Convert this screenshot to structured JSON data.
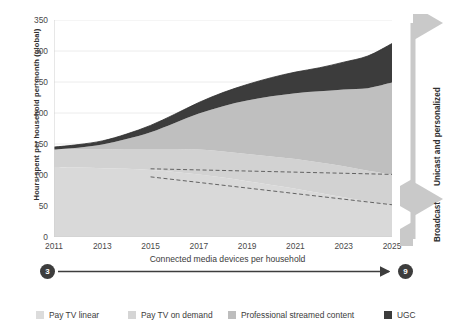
{
  "chart_data": {
    "type": "area",
    "title": "",
    "ylabel": "Hours spent per household per month (global)",
    "xlabel": "",
    "ylim": [
      0,
      350
    ],
    "yticks": [
      0,
      50,
      100,
      150,
      200,
      250,
      300,
      350
    ],
    "x": [
      2011,
      2012,
      2013,
      2014,
      2015,
      2016,
      2017,
      2018,
      2019,
      2020,
      2021,
      2022,
      2023,
      2024,
      2025
    ],
    "xticks": [
      2011,
      2013,
      2015,
      2017,
      2019,
      2021,
      2023,
      2025
    ],
    "grid": true,
    "legend_position": "bottom",
    "stacked": true,
    "series": [
      {
        "name": "Pay TV linear",
        "color": "#d9d9d9",
        "values": [
          113,
          112,
          111,
          110,
          108,
          105,
          101,
          96,
          90,
          84,
          78,
          71,
          64,
          57,
          51
        ]
      },
      {
        "name": "Pay TV on demand",
        "color": "#d2d2d2",
        "values": [
          28,
          29,
          30,
          32,
          34,
          37,
          40,
          42,
          44,
          46,
          48,
          49,
          50,
          50,
          50
        ]
      },
      {
        "name": "Professional streamed content",
        "color": "#bfbfbf",
        "values": [
          0,
          3,
          8,
          16,
          27,
          42,
          58,
          73,
          86,
          97,
          106,
          115,
          124,
          133,
          148
        ]
      },
      {
        "name": "UGC",
        "color": "#3c3c3c",
        "values": [
          4,
          5,
          6,
          8,
          11,
          14,
          18,
          22,
          26,
          30,
          34,
          38,
          44,
          52,
          63
        ]
      }
    ],
    "annotations": [
      {
        "name": "dashed-divider-upper",
        "style": "dashed",
        "x": [
          2015,
          2025
        ],
        "y": [
          110,
          101
        ]
      },
      {
        "name": "dashed-divider-lower",
        "style": "dashed",
        "x": [
          2015,
          2025
        ],
        "y": [
          97,
          52
        ]
      }
    ]
  },
  "side_annotations": {
    "upper": {
      "label": "Unicast and personalized"
    },
    "lower": {
      "label": "Broadcast"
    }
  },
  "devices_axis": {
    "start_value": "3",
    "end_value": "9",
    "label": "Connected media devices per household"
  },
  "legend": {
    "items": [
      {
        "label": "Pay TV linear",
        "color": "#dcdcdc"
      },
      {
        "label": "Pay TV on demand",
        "color": "#d5d5d5"
      },
      {
        "label": "Professional streamed content",
        "color": "#bdbdbd"
      },
      {
        "label": "UGC",
        "color": "#3c3c3c"
      }
    ]
  }
}
